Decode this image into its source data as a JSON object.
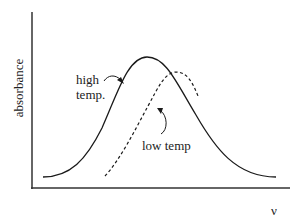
{
  "diagram": {
    "type": "absorption-band-comparison",
    "y_axis_label": "absorbance",
    "x_axis_label": "ν",
    "curves": [
      {
        "name": "high-temp-curve",
        "label": "high temp.",
        "label_lines": [
          "high",
          "temp."
        ],
        "style": "solid",
        "color": "#1a1a1a"
      },
      {
        "name": "low-temp-curve",
        "label": "low temp",
        "style": "dashed",
        "color": "#1a1a1a"
      }
    ]
  }
}
